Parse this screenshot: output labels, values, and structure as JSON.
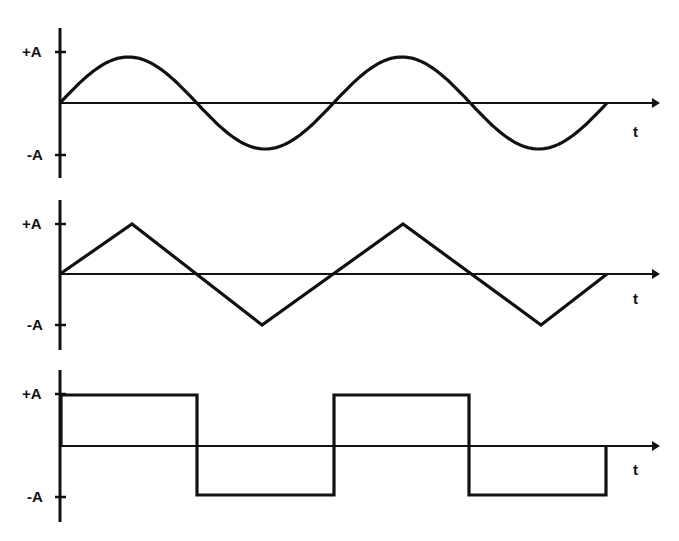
{
  "diagram": {
    "title": "",
    "panels": [
      {
        "name": "sine-wave",
        "waveform": "sine",
        "y_pos_label": "+A",
        "y_neg_label": "-A",
        "x_label": "t",
        "cycles": 2
      },
      {
        "name": "triangle-wave",
        "waveform": "triangle",
        "y_pos_label": "+A",
        "y_neg_label": "-A",
        "x_label": "t",
        "cycles": 2
      },
      {
        "name": "square-wave",
        "waveform": "square",
        "y_pos_label": "+A",
        "y_neg_label": "-A",
        "x_label": "t",
        "cycles": 2
      }
    ],
    "colors": {
      "stroke": "#111111",
      "background": "#ffffff"
    }
  }
}
